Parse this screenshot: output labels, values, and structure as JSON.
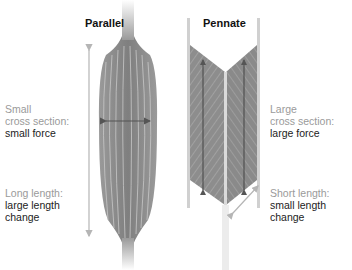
{
  "diagram": {
    "parallel": {
      "title": "Parallel",
      "cross_section_label": {
        "line1": "Small",
        "line2": "cross section:",
        "line3": "small force"
      },
      "length_label": {
        "line1": "Long length:",
        "line2": "large length",
        "line3": "change"
      }
    },
    "pennate": {
      "title": "Pennate",
      "cross_section_label": {
        "line1": "Large",
        "line2": "cross section:",
        "line3": "large force"
      },
      "length_label": {
        "line1": "Short length:",
        "line2": "small length",
        "line3": "change"
      }
    },
    "colors": {
      "muscle_gray": "#8a8a8a",
      "arrow_dark": "#555555",
      "arrow_light": "#b5b5b5",
      "label_gray": "#9a9a9a",
      "label_dark": "#222222"
    }
  }
}
